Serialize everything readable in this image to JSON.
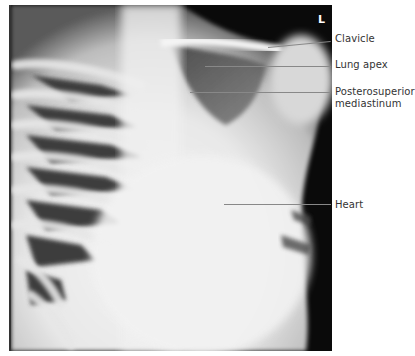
{
  "figure": {
    "type": "chest-radiograph",
    "side_marker": "L",
    "labels": [
      {
        "id": "clavicle",
        "text": "Clavicle"
      },
      {
        "id": "lung-apex",
        "text": "Lung apex"
      },
      {
        "id": "posterosuperior-mediastinum",
        "line1": "Posterosuperior",
        "line2": "mediastinum"
      },
      {
        "id": "heart",
        "text": "Heart"
      }
    ],
    "colors": {
      "background": "#ffffff",
      "film_dark": "#0a0a0a",
      "bone": "#f2f2f2",
      "leader_line": "#888888",
      "label_text": "#333333"
    }
  }
}
